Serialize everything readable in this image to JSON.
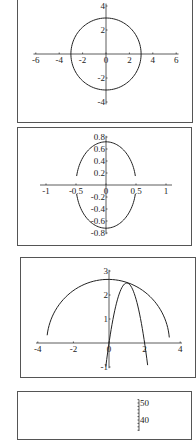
{
  "chart_data": [
    {
      "type": "line",
      "title": "",
      "description": "Circle of radius 3 centered at origin",
      "panel": {
        "left": 17,
        "top": -5,
        "right": 193,
        "bottom": 123
      },
      "origin_px": [
        106,
        54
      ],
      "scale_px": [
        11.7,
        12.0
      ],
      "xticks": [
        -6,
        -4,
        -2,
        0,
        2,
        4,
        6
      ],
      "xtick_labels": [
        "-6",
        "-4",
        "-2",
        "0",
        "2",
        "4",
        "6"
      ],
      "yticks": [
        4,
        2,
        -2,
        -4
      ],
      "ytick_labels": [
        "4",
        "2",
        "-2",
        "-4"
      ],
      "xlim": [
        -6.2,
        6.2
      ],
      "ylim": [
        -4.2,
        4.2
      ],
      "curves": [
        {
          "kind": "ellipse",
          "cx": 0,
          "cy": 0,
          "rx": 3,
          "ry": 3,
          "t0": 0,
          "t1": 360
        }
      ],
      "grid": false
    },
    {
      "type": "line",
      "title": "",
      "description": "Ellipse x=0.5cos t, y=0.72 sin t with gaps at x-axis",
      "panel": {
        "left": 17,
        "top": 127,
        "right": 192,
        "bottom": 246
      },
      "origin_px": [
        106,
        185
      ],
      "scale_px": [
        60,
        60
      ],
      "xticks": [
        -1,
        -0.5,
        0,
        0.5,
        1
      ],
      "xtick_labels": [
        "-1",
        "-0.5",
        "0",
        "0.5",
        "1"
      ],
      "yticks": [
        0.8,
        0.6,
        0.4,
        0.2,
        -0.2,
        -0.4,
        -0.6,
        -0.8
      ],
      "ytick_labels": [
        "0.8",
        "0.6",
        "0.4",
        "0.2",
        "-0.2",
        "-0.4",
        "-0.6",
        "-0.8"
      ],
      "xlim": [
        -1.1,
        1.1
      ],
      "ylim": [
        -0.82,
        0.82
      ],
      "curves": [
        {
          "kind": "ellipse",
          "cx": 0,
          "cy": 0,
          "rx": 0.5,
          "ry": 0.72,
          "t0": 12,
          "t1": 168
        },
        {
          "kind": "ellipse",
          "cx": 0,
          "cy": 0,
          "rx": 0.5,
          "ry": 0.72,
          "t0": 192,
          "t1": 348
        }
      ],
      "grid": false
    },
    {
      "type": "line",
      "title": "",
      "description": "Upper arc and parabola y = -2.5(x-1)^2 + 2.5",
      "panel": {
        "left": 20,
        "top": 257,
        "right": 196,
        "bottom": 378
      },
      "origin_px": [
        109,
        343
      ],
      "scale_px": [
        17.8,
        24.0
      ],
      "xticks": [
        -4,
        -2,
        0,
        2,
        4
      ],
      "xtick_labels": [
        "-4",
        "-2",
        "0",
        "2",
        "4"
      ],
      "yticks": [
        3,
        2,
        1,
        -1
      ],
      "ytick_labels": [
        "3",
        "2",
        "1",
        "-1"
      ],
      "xlim": [
        -4.1,
        4.1
      ],
      "ylim": [
        -1.05,
        3.05
      ],
      "curves": [
        {
          "kind": "ellipse",
          "cx": -0.05,
          "cy": 0,
          "rx": 3.45,
          "ry": 2.65,
          "t0": 5,
          "t1": 175
        },
        {
          "kind": "parabola",
          "a": -2.5,
          "h": 1,
          "k": 2.5,
          "x0": -0.18,
          "x1": 2.18
        }
      ],
      "grid": false
    },
    {
      "type": "line",
      "title": "",
      "description": "Partially visible chart (cut off at bottom)",
      "panel": {
        "left": 17,
        "top": 391,
        "right": 192,
        "bottom": 440
      },
      "origin_px": [
        139,
        488
      ],
      "scale_px": [
        1,
        1.7
      ],
      "xticks": [],
      "xtick_labels": [],
      "yticks": [
        50,
        40
      ],
      "ytick_labels": [
        "50",
        "40"
      ],
      "minor_yticks_step": 2,
      "ylim": [
        30,
        52
      ],
      "curves": [],
      "grid": false,
      "no_x_axis": true
    }
  ]
}
